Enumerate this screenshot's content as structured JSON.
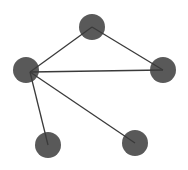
{
  "graph": {
    "type": "undirected-graph",
    "node_color": "#595959",
    "edge_color": "#3a3a3a",
    "node_radius": 13,
    "nodes": [
      {
        "id": "top",
        "x": 92,
        "y": 27
      },
      {
        "id": "left",
        "x": 26,
        "y": 70
      },
      {
        "id": "right",
        "x": 163,
        "y": 70
      },
      {
        "id": "bottom-left",
        "x": 48,
        "y": 145
      },
      {
        "id": "bottom-right",
        "x": 135,
        "y": 143
      }
    ],
    "edges": [
      {
        "from": "left",
        "to": "top"
      },
      {
        "from": "top",
        "to": "right"
      },
      {
        "from": "left",
        "to": "right"
      },
      {
        "from": "left",
        "to": "bottom-left"
      },
      {
        "from": "left",
        "to": "bottom-right"
      }
    ]
  }
}
